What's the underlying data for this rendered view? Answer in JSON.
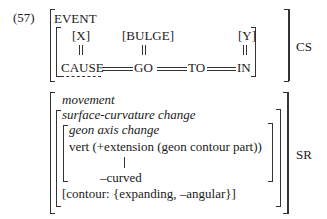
{
  "example_number": "(57)",
  "cs": {
    "label": "CS",
    "event": "EVENT",
    "args": {
      "x": "[X]",
      "bulge": "[BULGE]",
      "y": "[Y]"
    },
    "chain": [
      "CAUSE",
      "GO",
      "TO",
      "IN"
    ]
  },
  "sr": {
    "label": "SR",
    "movement": "movement",
    "surface": "surface-curvature change",
    "geon_axis": "geon axis change",
    "vert": "vert (+extension (geon contour part))",
    "curved": "–curved",
    "contour": "[contour: {expanding, –angular}]"
  }
}
